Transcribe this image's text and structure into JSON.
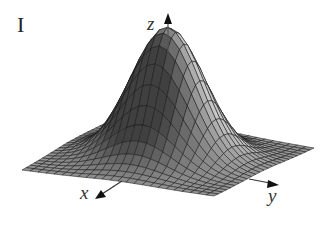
{
  "figure": {
    "panel_label": "I",
    "axes": {
      "x_label": "x",
      "y_label": "y",
      "z_label": "z"
    },
    "surface": {
      "type": "gaussian-peak",
      "grid_lines": 24,
      "fill_color": "#8c8c8c",
      "line_color": "#1a1a1a",
      "shade_light": "#b4b4b4",
      "shade_dark": "#3a3a3a"
    }
  },
  "chart_data": {
    "type": "surface",
    "title": "I",
    "xlabel": "x",
    "ylabel": "y",
    "zlabel": "z",
    "function": "z = exp(-(x^2 + y^2)) style peak (bell-shaped bump centered at origin)",
    "grid": "approximately 24 x 24 mesh",
    "peak": {
      "x": 0,
      "y": 0,
      "z": 1
    },
    "edges_z": 0
  }
}
